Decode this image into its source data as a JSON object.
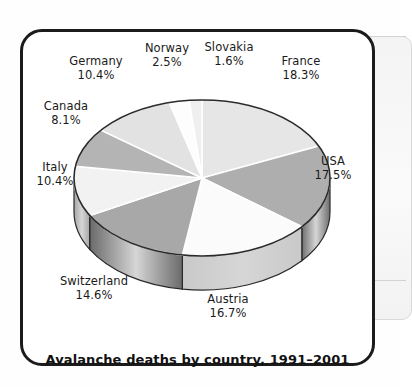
{
  "caption": "Avalanche deaths by country, 1991–2001",
  "chart_data": {
    "type": "pie",
    "title": "Avalanche deaths by country, 1991–2001",
    "xlabel": "",
    "ylabel": "",
    "units": "percent",
    "legend_position": "labels-around-pie",
    "grid": false,
    "three_d": true,
    "start_angle_deg": 0,
    "direction": "clockwise",
    "categories": [
      "France",
      "USA",
      "Austria",
      "Switzerland",
      "Italy",
      "Canada",
      "Germany",
      "Norway",
      "Slovakia"
    ],
    "values": [
      18.3,
      17.5,
      16.7,
      14.6,
      10.4,
      8.1,
      10.4,
      2.5,
      1.6
    ],
    "slices": [
      {
        "name": "France",
        "value": 18.3,
        "label": "France",
        "percent_label": "18.3%",
        "fill": "#e6e6e6",
        "side": "#9a9a9a"
      },
      {
        "name": "USA",
        "value": 17.5,
        "label": "USA",
        "percent_label": "17.5%",
        "fill": "#aeaeae",
        "side": "#6e6e6e"
      },
      {
        "name": "Austria",
        "value": 16.7,
        "label": "Austria",
        "percent_label": "16.7%",
        "fill": "#fbfbfb",
        "side": "#c9c9c9"
      },
      {
        "name": "Switzerland",
        "value": 14.6,
        "label": "Switzerland",
        "percent_label": "14.6%",
        "fill": "#a8a8a8",
        "side": "#6a6a6a"
      },
      {
        "name": "Italy",
        "value": 10.4,
        "label": "Italy",
        "percent_label": "10.4%",
        "fill": "#f2f2f2",
        "side": "#a6a6a6"
      },
      {
        "name": "Canada",
        "value": 8.1,
        "label": "Canada",
        "percent_label": "8.1%",
        "fill": "#b4b4b4",
        "side": "#7a7a7a"
      },
      {
        "name": "Germany",
        "value": 10.4,
        "label": "Germany",
        "percent_label": "10.4%",
        "fill": "#e2e2e2",
        "side": "#9b9b9b"
      },
      {
        "name": "Norway",
        "value": 2.5,
        "label": "Norway",
        "percent_label": "2.5%",
        "fill": "#fdfdfd",
        "side": "#cccccc"
      },
      {
        "name": "Slovakia",
        "value": 1.6,
        "label": "Slovakia",
        "percent_label": "1.6%",
        "fill": "#efefef",
        "side": "#bbbbbb"
      }
    ]
  },
  "labels": {
    "germany": {
      "name": "Germany",
      "percent": "10.4%"
    },
    "norway": {
      "name": "Norway",
      "percent": "2.5%"
    },
    "slovakia": {
      "name": "Slovakia",
      "percent": "1.6%"
    },
    "france": {
      "name": "France",
      "percent": "18.3%"
    },
    "canada": {
      "name": "Canada",
      "percent": "8.1%"
    },
    "usa": {
      "name": "USA",
      "percent": "17.5%"
    },
    "italy": {
      "name": "Italy",
      "percent": "10.4%"
    },
    "switzerland": {
      "name": "Switzerland",
      "percent": "14.6%"
    },
    "austria": {
      "name": "Austria",
      "percent": "16.7%"
    }
  },
  "colors": {
    "frame": "#1b1b1b",
    "background": "#ffffff",
    "text": "#1a1a1a",
    "pie_outline": "#2a2a2a"
  }
}
